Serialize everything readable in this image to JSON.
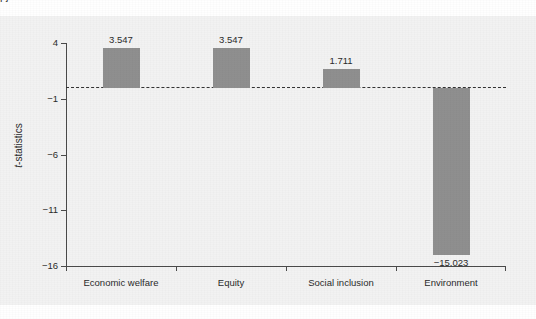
{
  "page": {
    "clipped_text_above": "pj",
    "background_color": "#ffffff",
    "panel_color": "#f2f2f2"
  },
  "chart_data": {
    "type": "bar",
    "title": "",
    "subtitle": "",
    "xlabel": "",
    "ylabel": "t-statistics",
    "ylabel_italic_prefix": "t",
    "ylabel_rest": "-statistics",
    "categories": [
      "Economic welfare",
      "Equity",
      "Social inclusion",
      "Environment"
    ],
    "values": [
      3.547,
      3.547,
      1.711,
      -15.023
    ],
    "value_labels": [
      "3.547",
      "3.547",
      "1.711",
      "−15.023"
    ],
    "ylim": [
      -16,
      4
    ],
    "yticks": [
      4,
      -1,
      -6,
      -11,
      -16
    ],
    "ytick_labels": [
      "4",
      "−1",
      "−6",
      "−11",
      "−16"
    ],
    "grid": false,
    "legend": "none",
    "reference_line": {
      "value": 0,
      "style": "dashed",
      "color": "#333333",
      "label": ""
    },
    "bar_color": "#8f8f8f",
    "axis_color": "#4a4a4a"
  }
}
